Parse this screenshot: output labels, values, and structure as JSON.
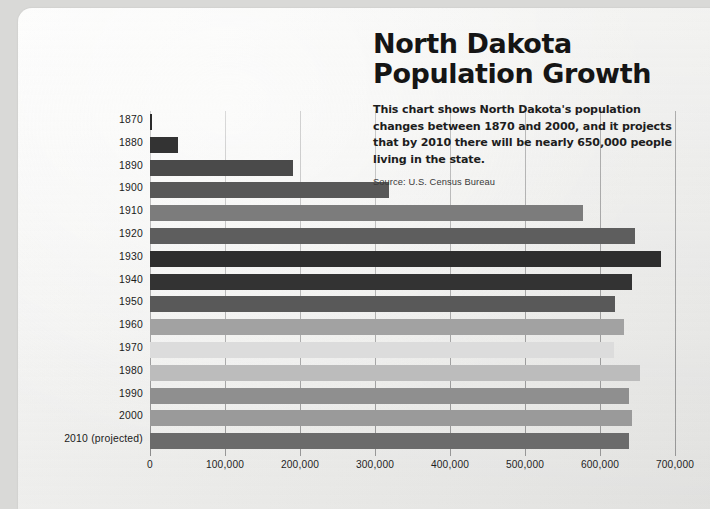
{
  "header": {
    "title_line1": "North Dakota",
    "title_line2": "Population Growth",
    "description": "This chart shows North Dakota's population changes between 1870 and 2000, and it projects that by 2010 there will be nearly 650,000 people living in the state.",
    "source": "Source: U.S. Census Bureau"
  },
  "chart_data": {
    "type": "bar",
    "orientation": "horizontal",
    "title": "North Dakota Population Growth",
    "subtitle": "This chart shows North Dakota's population changes between 1870 and 2000, and it projects that by 2010 there will be nearly 650,000 people living in the state.",
    "source": "Source: U.S. Census Bureau",
    "xlabel": "",
    "ylabel": "",
    "xlim": [
      0,
      700000
    ],
    "xticks": [
      0,
      100000,
      200000,
      300000,
      400000,
      500000,
      600000,
      700000
    ],
    "xtick_labels": [
      "0",
      "100,000",
      "200,000",
      "300,000",
      "400,000",
      "500,000",
      "600,000",
      "700,000"
    ],
    "grid": true,
    "grid_axis": "x",
    "legend": false,
    "categories": [
      "1870",
      "1880",
      "1890",
      "1900",
      "1910",
      "1920",
      "1930",
      "1940",
      "1950",
      "1960",
      "1970",
      "1980",
      "1990",
      "2000",
      "2010 (projected)"
    ],
    "values": [
      2400,
      37000,
      191000,
      319000,
      577000,
      647000,
      681000,
      642000,
      620000,
      632000,
      618000,
      653000,
      639000,
      642000,
      638000
    ],
    "bar_colors": [
      "#2b2b2b",
      "#333333",
      "#4a4a4a",
      "#585858",
      "#7c7c7c",
      "#5e5e5e",
      "#2e2e2e",
      "#333333",
      "#595959",
      "#a2a2a2",
      "#dcdcdc",
      "#bcbcbc",
      "#8f8f8f",
      "#9a9a9a",
      "#6b6b6b"
    ]
  },
  "colors": {
    "page_background": "#d9d9d7",
    "paper": "#f4f4f2",
    "text": "#151515",
    "gridline": "#9a9a9a"
  }
}
